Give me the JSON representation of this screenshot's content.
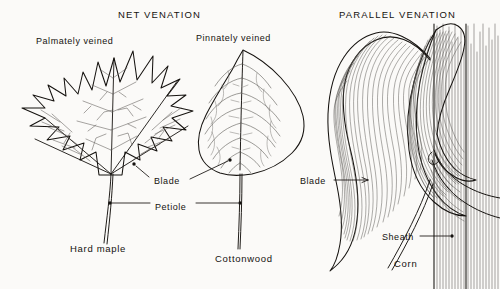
{
  "figure": {
    "type": "botanical-line-diagram",
    "background_color": "#fbfaf8",
    "ink_color": "#15120f"
  },
  "headings": [
    {
      "id": "net",
      "text": "NET  VENATION",
      "x": 118,
      "y": 9
    },
    {
      "id": "parallel",
      "text": "PARALLEL  VENATION",
      "x": 339,
      "y": 9
    }
  ],
  "subtitles": [
    {
      "id": "palmate",
      "text": "Palmately veined",
      "x": 36,
      "y": 36
    },
    {
      "id": "pinnate",
      "text": "Pinnately veined",
      "x": 196,
      "y": 33
    }
  ],
  "specimens": [
    {
      "id": "hard-maple",
      "name": "Hard maple",
      "venation": "palmate",
      "x": 70,
      "y": 243
    },
    {
      "id": "cottonwood",
      "name": "Cottonwood",
      "venation": "pinnate",
      "x": 215,
      "y": 253
    },
    {
      "id": "corn",
      "name": "Corn",
      "venation": "parallel",
      "x": 394,
      "y": 258
    }
  ],
  "callouts": [
    {
      "id": "blade-maple",
      "text": "Blade",
      "x": 154,
      "y": 176,
      "target": "maple leaf blade"
    },
    {
      "id": "petiole",
      "text": "Petiole",
      "x": 155,
      "y": 202,
      "target": "leaf stalk"
    },
    {
      "id": "blade-corn",
      "text": "Blade",
      "x": 300,
      "y": 176,
      "target": "corn leaf blade"
    },
    {
      "id": "sheath",
      "text": "Sheath",
      "x": 382,
      "y": 232,
      "target": "corn leaf sheath"
    }
  ],
  "icon_names": [
    "maple-leaf-icon",
    "cottonwood-leaf-icon",
    "corn-plant-icon",
    "pointer-line-icon",
    "pointer-dot-icon"
  ]
}
